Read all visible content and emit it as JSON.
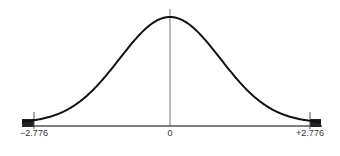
{
  "chart_data": {
    "type": "line",
    "title": "",
    "xlabel": "",
    "ylabel": "",
    "tick_labels": [
      "−2.776",
      "0",
      "+2.776"
    ],
    "critical_values": [
      -2.776,
      2.776
    ],
    "center": 0,
    "shaded_regions": [
      "left tail beyond -2.776",
      "right tail beyond +2.776"
    ],
    "xlim": [
      -3.4,
      3.4
    ],
    "grid": false,
    "colors": {
      "curve": "#111111",
      "axis": "#555555",
      "shade": "#222222",
      "center_line": "#777777"
    }
  },
  "labels": {
    "left": "−2.776",
    "center": "0",
    "right": "+2.776"
  }
}
